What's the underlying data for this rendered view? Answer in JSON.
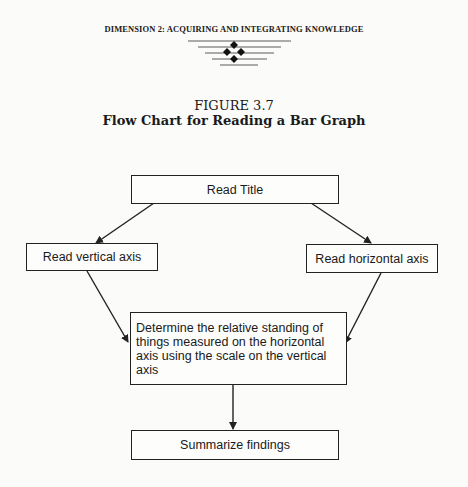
{
  "page": {
    "header": "DIMENSION 2: ACQUIRING AND INTEGRATING KNOWLEDGE",
    "ornament_icon": "diamond-cluster-ornament"
  },
  "figure": {
    "number": "FIGURE 3.7",
    "title": "Flow Chart for Reading a Bar Graph"
  },
  "flowchart": {
    "nodes": [
      {
        "id": "read-title",
        "label": "Read Title"
      },
      {
        "id": "read-vertical",
        "label": "Read vertical axis"
      },
      {
        "id": "read-horizontal",
        "label": "Read horizontal axis"
      },
      {
        "id": "determine",
        "label": "Determine the relative standing of things measured on the horizontal axis using the scale on the vertical axis"
      },
      {
        "id": "summarize",
        "label": "Summarize findings"
      }
    ],
    "edges": [
      {
        "from": "read-title",
        "to": "read-vertical"
      },
      {
        "from": "read-title",
        "to": "read-horizontal"
      },
      {
        "from": "read-vertical",
        "to": "determine"
      },
      {
        "from": "read-horizontal",
        "to": "determine"
      },
      {
        "from": "determine",
        "to": "summarize"
      }
    ],
    "line_color": "#222222"
  }
}
